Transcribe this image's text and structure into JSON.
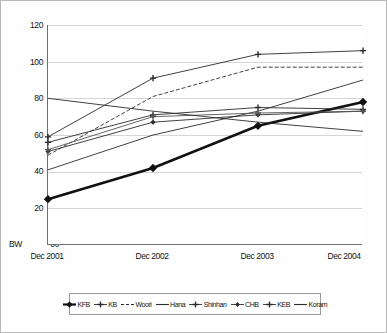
{
  "chart_data": {
    "type": "line",
    "title": "",
    "xlabel": "",
    "ylabel": "BW 0.0",
    "unit_label": "BW",
    "categories": [
      "Dec 2001",
      "Dec 2002",
      "Dec 2003",
      "Dec 2004"
    ],
    "ylim": [
      0,
      120
    ],
    "yticks": [
      0,
      20,
      40,
      60,
      80,
      100,
      120
    ],
    "ytick_labels": [
      "00",
      "20",
      "40",
      "60",
      "80",
      "100",
      "120"
    ],
    "grid": true,
    "legend_position": "bottom",
    "series": [
      {
        "name": "KFB",
        "values": [
          25,
          42,
          65,
          78
        ],
        "marker": "diamond",
        "style": "thick",
        "color": "#111111"
      },
      {
        "name": "KB",
        "values": [
          59,
          91,
          104,
          106
        ],
        "marker": "plus",
        "style": "thin",
        "color": "#2b2b2b"
      },
      {
        "name": "Woori",
        "values": [
          49,
          81,
          97,
          97
        ],
        "marker": "none",
        "style": "dashed",
        "color": "#2b2b2b"
      },
      {
        "name": "Hana",
        "values": [
          41,
          60,
          73,
          90
        ],
        "marker": "none",
        "style": "thin",
        "color": "#2b2b2b"
      },
      {
        "name": "Shinhan",
        "values": [
          56,
          71,
          75,
          74
        ],
        "marker": "plus",
        "style": "thin",
        "color": "#2b2b2b"
      },
      {
        "name": "CHB",
        "values": [
          51,
          67,
          71,
          73
        ],
        "marker": "diamond",
        "style": "thin",
        "color": "#2b2b2b"
      },
      {
        "name": "KEB",
        "values": [
          52,
          70,
          72,
          73
        ],
        "marker": "plus",
        "style": "thin",
        "color": "#555555"
      },
      {
        "name": "Koram",
        "values": [
          80,
          73,
          67,
          62
        ],
        "marker": "none",
        "style": "thin",
        "color": "#2b2b2b"
      }
    ]
  },
  "legend": {
    "items": [
      {
        "label": "KFB",
        "marker": "diamond-thick-marker"
      },
      {
        "label": "KB",
        "marker": "plus-marker"
      },
      {
        "label": "Woori",
        "marker": "dashed-line-marker"
      },
      {
        "label": "Hana",
        "marker": "solid-line-marker"
      },
      {
        "label": "Shinhan",
        "marker": "plus-marker"
      },
      {
        "label": "CHB",
        "marker": "diamond-marker"
      },
      {
        "label": "KEB",
        "marker": "plus-marker"
      },
      {
        "label": "Koram",
        "marker": "solid-line-marker"
      }
    ]
  }
}
